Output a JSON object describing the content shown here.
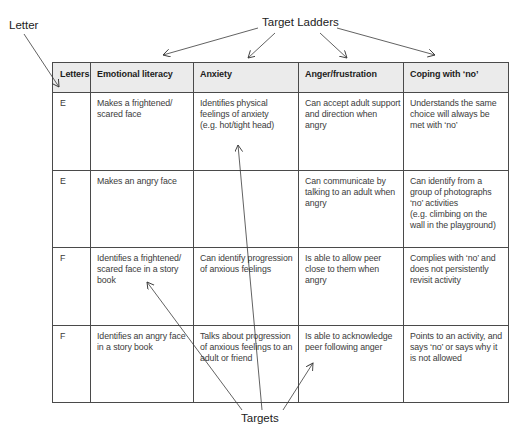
{
  "annotations": {
    "letter_label": "Letter",
    "target_ladders_label": "Target Ladders",
    "targets_label": "Targets"
  },
  "table": {
    "headers": {
      "letters": "Letters",
      "emotional_literacy": "Emotional literacy",
      "anxiety": "Anxiety",
      "anger_frustration": "Anger/frustration",
      "coping_with_no": "Coping with ‘no’"
    },
    "rows": [
      {
        "letter": "E",
        "emotional_literacy": "Makes a frightened/\nscared face",
        "anxiety": "Identifies physical\nfeelings of anxiety\n(e.g. hot/tight head)",
        "anger_frustration": "Can accept adult support\nand direction when\nangry",
        "coping_with_no": "Understands the same\nchoice will always be\nmet with ‘no’"
      },
      {
        "letter": "E",
        "emotional_literacy": "Makes an angry face",
        "anxiety": "",
        "anger_frustration": "Can communicate by\ntalking to an adult when\nangry",
        "coping_with_no": "Can identify from a\ngroup of photographs\n‘no’ activities\n(e.g. climbing on the\nwall in the playground)"
      },
      {
        "letter": "F",
        "emotional_literacy": "Identifies a frightened/\nscared face in a story\nbook",
        "anxiety": "Can identify progression\nof anxious feelings",
        "anger_frustration": "Is able to allow peer\nclose to them when\nangry",
        "coping_with_no": "Complies with ‘no’ and\ndoes not persistently\nrevisit activity"
      },
      {
        "letter": "F",
        "emotional_literacy": "Identifies an angry face\nin a story book",
        "anxiety": "Talks about progression\nof anxious feelings to an\nadult or friend",
        "anger_frustration": "Is able to acknowledge\npeer following anger",
        "coping_with_no": "Points to an activity, and\nsays ‘no’ or says why it\nis not allowed"
      }
    ]
  },
  "colors": {
    "header_background": "#ebebeb",
    "border": "#4a4a4a",
    "text": "#3b3b3b"
  }
}
